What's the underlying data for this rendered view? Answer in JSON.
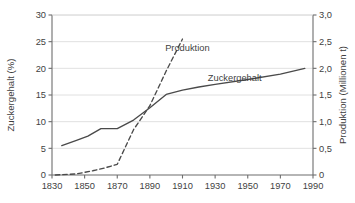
{
  "chart_data": {
    "type": "line",
    "title": "",
    "xlabel": "",
    "xlim": [
      1830,
      1990
    ],
    "xticks": [
      "1830",
      "1850",
      "1870",
      "1890",
      "1910",
      "1930",
      "1950",
      "1970",
      "1990"
    ],
    "xtick_values": [
      1830,
      1850,
      1870,
      1890,
      1910,
      1930,
      1950,
      1970,
      1990
    ],
    "grid": true,
    "grid_axis": "y",
    "legend_position": "inline-annotations",
    "axes": [
      {
        "id": "left",
        "label": "Zuckergehalt (%)",
        "ylim": [
          0,
          30
        ],
        "yticks": [
          "0",
          "5",
          "10",
          "15",
          "20",
          "25",
          "30"
        ],
        "ytick_values": [
          0,
          5,
          10,
          15,
          20,
          25,
          30
        ]
      },
      {
        "id": "right",
        "label": "Produktion (Millionen t)",
        "ylim": [
          0,
          3.0
        ],
        "yticks": [
          "0",
          "0,5",
          "1,0",
          "1,5",
          "2,0",
          "2,5",
          "3,0"
        ],
        "ytick_values": [
          0,
          0.5,
          1.0,
          1.5,
          2.0,
          2.5,
          3.0
        ]
      }
    ],
    "series": [
      {
        "name": "Zuckergehalt",
        "axis": "left",
        "unit": "%",
        "style": "solid",
        "color": "#4a4a4a",
        "label_text": "Zuckergehalt",
        "label_x": 1942,
        "label_y": 17.6,
        "points": [
          {
            "x": 1836,
            "y": 5.5
          },
          {
            "x": 1845,
            "y": 6.5
          },
          {
            "x": 1852,
            "y": 7.3
          },
          {
            "x": 1860,
            "y": 8.7
          },
          {
            "x": 1870,
            "y": 8.7
          },
          {
            "x": 1880,
            "y": 10.3
          },
          {
            "x": 1890,
            "y": 12.6
          },
          {
            "x": 1900,
            "y": 15.1
          },
          {
            "x": 1910,
            "y": 15.9
          },
          {
            "x": 1920,
            "y": 16.5
          },
          {
            "x": 1930,
            "y": 17.0
          },
          {
            "x": 1950,
            "y": 17.9
          },
          {
            "x": 1970,
            "y": 18.9
          },
          {
            "x": 1985,
            "y": 20.0
          }
        ]
      },
      {
        "name": "Produktion",
        "axis": "right",
        "unit": "Millionen t",
        "style": "dashed",
        "color": "#4a4a4a",
        "label_text": "Produktion",
        "label_x": 1913,
        "label_y": 2.33,
        "points": [
          {
            "x": 1832,
            "y": 0.0
          },
          {
            "x": 1845,
            "y": 0.02
          },
          {
            "x": 1855,
            "y": 0.08
          },
          {
            "x": 1862,
            "y": 0.13
          },
          {
            "x": 1870,
            "y": 0.2
          },
          {
            "x": 1880,
            "y": 0.85
          },
          {
            "x": 1890,
            "y": 1.3
          },
          {
            "x": 1900,
            "y": 1.95
          },
          {
            "x": 1910,
            "y": 2.55
          }
        ]
      }
    ]
  }
}
